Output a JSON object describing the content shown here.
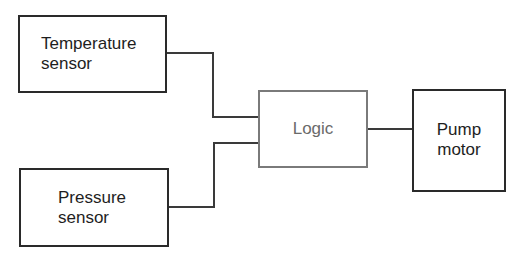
{
  "diagram": {
    "nodes": [
      {
        "id": "temperature-sensor",
        "label_line1": "Temperature",
        "label_line2": "sensor"
      },
      {
        "id": "pressure-sensor",
        "label_line1": "Pressure",
        "label_line2": "sensor"
      },
      {
        "id": "logic",
        "label": "Logic"
      },
      {
        "id": "pump-motor",
        "label_line1": "Pump",
        "label_line2": "motor"
      }
    ],
    "edges": [
      {
        "from": "temperature-sensor",
        "to": "logic"
      },
      {
        "from": "pressure-sensor",
        "to": "logic"
      },
      {
        "from": "logic",
        "to": "pump-motor"
      }
    ]
  }
}
